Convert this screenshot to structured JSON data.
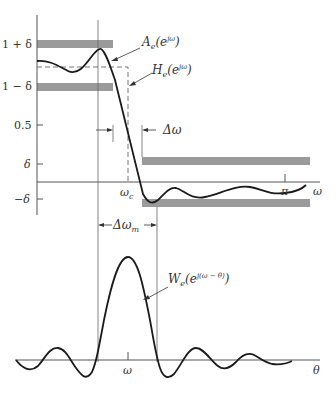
{
  "diagram": {
    "type": "filter-design-window-convolution",
    "colors": {
      "curve": "#1a1a1a",
      "axis": "#555555",
      "band": "#9a9a9a",
      "text": "#333333",
      "background": "#ffffff"
    },
    "top_plot": {
      "y_tick_labels": [
        "1 + δ",
        "1 − δ",
        "0.5",
        "δ",
        "−δ"
      ],
      "x_tick_labels": [
        "ω_c",
        "π"
      ],
      "x_axis_label": "ω",
      "curve_labels": {
        "approx": "A_e(e^{jω})",
        "ideal": "H_e(e^{jω})"
      },
      "annotations": {
        "transition_width": "Δω"
      }
    },
    "bottom_plot": {
      "x_tick_labels": [
        "ω"
      ],
      "x_axis_label": "θ",
      "curve_label": "W_e(e^{j(ω − θ)})",
      "annotations": {
        "mainlobe_width": "Δω_m"
      }
    }
  },
  "labels": {
    "one_plus_delta": "1 + δ",
    "one_minus_delta": "1 − δ",
    "half": "0.5",
    "delta": "δ",
    "neg_delta": "−δ",
    "omega_c_main": "ω",
    "omega_c_sub": "c",
    "pi": "π",
    "omega_axis": "ω",
    "A_main": "A",
    "A_sub": "e",
    "A_arg": "(e",
    "A_sup": "jω",
    "A_close": ")",
    "H_main": "H",
    "H_sub": "e",
    "H_arg": "(e",
    "H_sup": "jω",
    "H_close": ")",
    "delta_omega": "Δω",
    "delta_omega_m_main": "Δω",
    "delta_omega_m_sub": "m",
    "W_main": "W",
    "W_sub": "e",
    "W_arg": "(e",
    "W_sup": "j(ω − θ)",
    "W_close": ")",
    "omega_tick": "ω",
    "theta_axis": "θ"
  }
}
